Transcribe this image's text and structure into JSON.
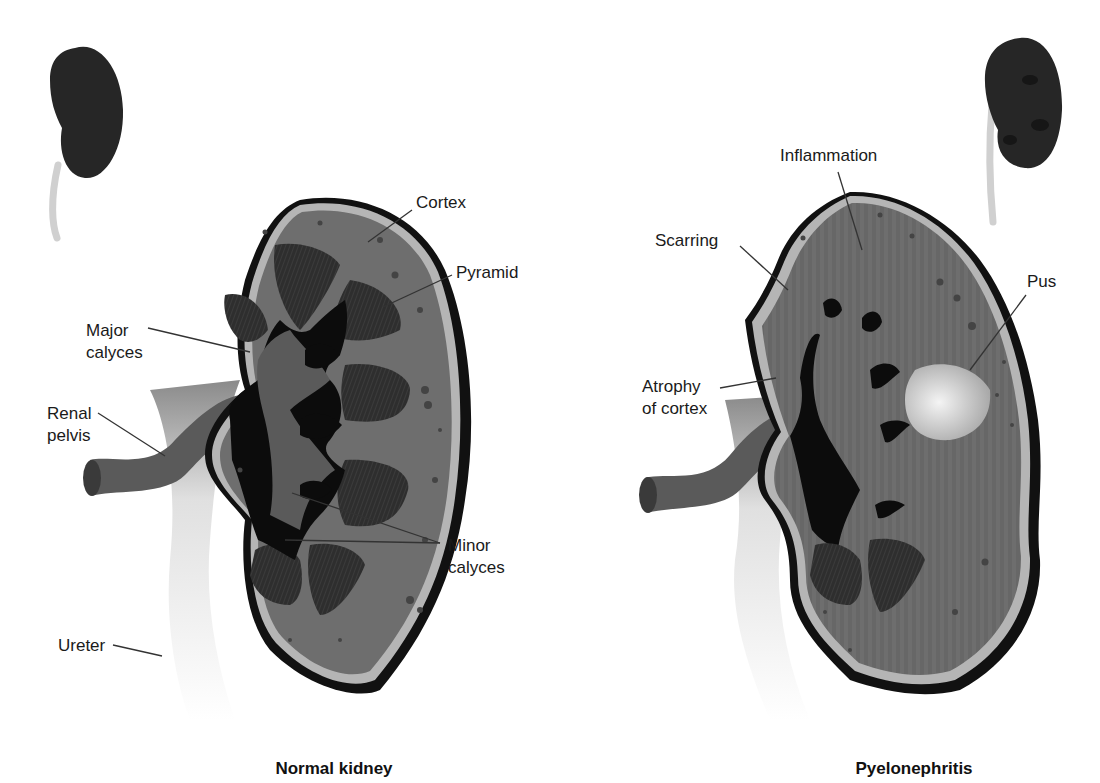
{
  "figure": {
    "colors": {
      "capsule": "#111111",
      "cortex_rim": "#b5b5b5",
      "cortex": "#6e6e6e",
      "pyramid": "#2e2e2e",
      "calyx": "#5a5a5a",
      "cavity": "#0c0c0c",
      "ureter": "#e8e8e8",
      "pus": "#d9d9d9",
      "whole_kidney": "#262626"
    },
    "panels": [
      {
        "title": "Normal kidney",
        "labels": {
          "cortex": "Cortex",
          "pyramid": "Pyramid",
          "major_calyces": [
            "Major",
            "calyces"
          ],
          "renal_pelvis": [
            "Renal",
            "pelvis"
          ],
          "minor_calyces": [
            "Minor",
            "calyces"
          ],
          "ureter": "Ureter"
        }
      },
      {
        "title": "Pyelonephritis",
        "labels": {
          "inflammation": "Inflammation",
          "scarring": "Scarring",
          "pus": "Pus",
          "atrophy_of_cortex": [
            "Atrophy",
            "of cortex"
          ]
        }
      }
    ]
  }
}
